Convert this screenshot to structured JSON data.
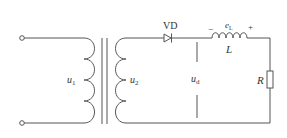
{
  "diagram": {
    "type": "half-wave rectifier with inductive load",
    "labels": {
      "primary_voltage": "u",
      "primary_voltage_sub": "1",
      "secondary_voltage": "u",
      "secondary_voltage_sub": "2",
      "diode": "VD",
      "inductor_emf": "e",
      "inductor_emf_sub": "L",
      "inductor": "L",
      "emf_minus": "−",
      "emf_plus": "+",
      "output_voltage": "u",
      "output_voltage_sub": "d",
      "resistor": "R"
    },
    "colors": {
      "line": "#555555",
      "text": "#333333",
      "background": "#ffffff"
    }
  }
}
